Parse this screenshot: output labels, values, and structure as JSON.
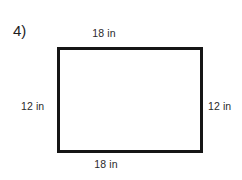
{
  "figure": {
    "problem_number": "4)",
    "shape": "rectangle",
    "stroke_color": "#151515",
    "fill_color": "#ffffff",
    "background_color": "#ffffff",
    "text_color": "#2a2a2a",
    "labels": {
      "top": "18 in",
      "bottom": "18 in",
      "left": "12 in",
      "right": "12 in"
    },
    "dimensions": {
      "width_value": "18",
      "height_value": "12",
      "unit": "in"
    }
  }
}
